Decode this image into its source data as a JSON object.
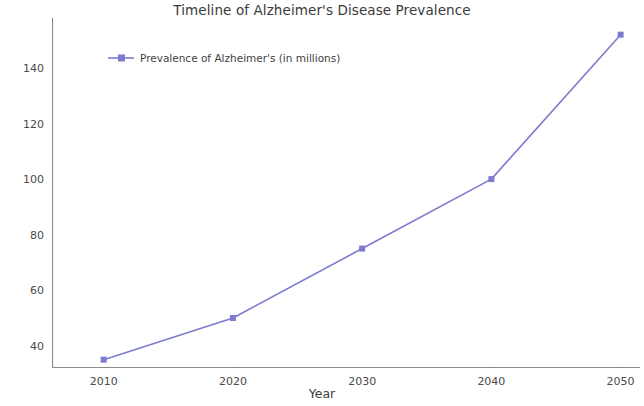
{
  "chart_data": {
    "type": "line",
    "title": "Timeline of Alzheimer's Disease Prevalence",
    "xlabel": "Year",
    "ylabel": "Number of Cases (millions)",
    "x": [
      2010,
      2020,
      2030,
      2040,
      2050
    ],
    "series": [
      {
        "name": "Prevalence of Alzheimer's (in millions)",
        "values": [
          35,
          50,
          75,
          100,
          152
        ],
        "color": "#7d7bce",
        "marker": "square",
        "linewidth": 1.6
      }
    ],
    "xtick_labels": [
      "2010",
      "2020",
      "2030",
      "2040",
      "2050"
    ],
    "ytick_labels": [
      "40",
      "60",
      "80",
      "100",
      "120",
      "140"
    ],
    "yticks": [
      40,
      60,
      80,
      100,
      120,
      140
    ],
    "xlim": [
      2006,
      2051.5
    ],
    "ylim": [
      32,
      158
    ],
    "grid": false,
    "legend_position": "upper left",
    "legend_frame": false,
    "spines": {
      "left": true,
      "bottom": true,
      "top": false,
      "right": false,
      "color": "#8a8a8a"
    },
    "background": "#ffffff",
    "text_color": "#3b3b3b"
  },
  "legend": {
    "entries": [
      {
        "label": "Prevalence of Alzheimer's (in millions)",
        "color": "#7d7bce"
      }
    ]
  }
}
